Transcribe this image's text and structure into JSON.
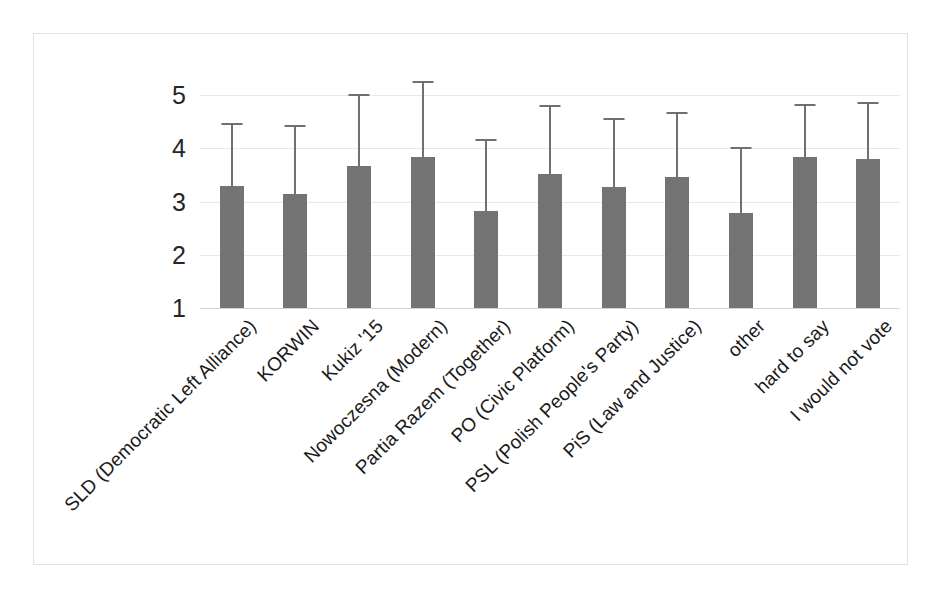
{
  "chart_data": {
    "type": "bar",
    "title": "",
    "subtitle": "",
    "xlabel": "",
    "ylabel": "",
    "ylim": [
      1,
      5
    ],
    "yticks": [
      "1",
      "2",
      "3",
      "4",
      "5"
    ],
    "grid": "horizontal",
    "legend": "none",
    "error_bars": "upper only (one-sided whisker with cap)",
    "bar_color": "#737373",
    "error_bar_color": "#707070",
    "gridline_color": "#e8e8e8",
    "frame_color": "#e3e3e3",
    "categories": [
      "SLD (Democratic Left Alliance)",
      "KORWIN",
      "Kukiz '15",
      "Nowoczesna (Modern)",
      "Partia Razem (Together)",
      "PO (Civic Platform)",
      "PSL (Polish People's Party)",
      "PiS (Law and Justice)",
      "other",
      "hard to say",
      "I would not vote"
    ],
    "values": [
      3.3,
      3.14,
      3.66,
      3.83,
      2.83,
      3.52,
      3.27,
      3.46,
      2.79,
      3.83,
      3.79
    ],
    "error_upper": [
      4.47,
      4.43,
      5.02,
      5.26,
      4.18,
      4.82,
      4.56,
      4.69,
      4.03,
      4.84,
      4.86
    ],
    "series": [
      {
        "name": "mean",
        "values": [
          3.3,
          3.14,
          3.66,
          3.83,
          2.83,
          3.52,
          3.27,
          3.46,
          2.79,
          3.83,
          3.79
        ]
      }
    ]
  }
}
